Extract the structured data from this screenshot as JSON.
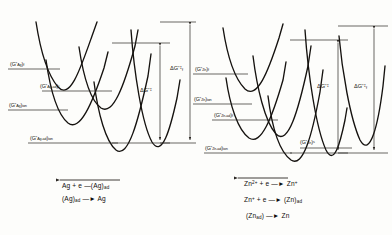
{
  "figure": {
    "panels": [
      {
        "id": "silver",
        "element": "Ag",
        "levels": [
          {
            "name": "ag-final-state",
            "text": "(G*Ag)f",
            "html": "(G<sup>*</sup><sub>Ag</sub>)<sub>f</sub>"
          },
          {
            "name": "ag-ad-final-state",
            "text": "(G*Ag-ad)f",
            "html": "(G<sup>*</sup><sub>Ag-ad</sub>)<sub>f</sub>"
          },
          {
            "name": "ag-ion-state",
            "text": "(G*Ag)ion",
            "html": "(G<sup>*</sup><sub>Ag</sub>)<sub>ion</sub>"
          },
          {
            "name": "ag-ad-ion-state",
            "text": "(G*Ag-ad)ion",
            "html": "(G<sup>*</sup><sub>Ag-ad</sub>)<sub>ion</sub>"
          }
        ],
        "deltas": [
          {
            "name": "delta-g-forward",
            "text": "ΔG*‡f",
            "html": "&Delta;G<sup>*&#8225;</sup><sub>f</sub>"
          },
          {
            "name": "delta-g",
            "text": "ΔG*‡",
            "html": "&Delta;G<sup>*&#8225;</sup>"
          }
        ],
        "reactions": [
          {
            "name": "reaction-ag-reduction",
            "html": "Ag + e &#8212;(Ag)<sub>ad</sub>",
            "reversible": true
          },
          {
            "name": "reaction-ag-incorporation",
            "html": "(Ag)<sub>ad</sub> &#8212;&#9658; Ag",
            "reversible": false
          }
        ]
      },
      {
        "id": "zinc",
        "element": "Zn",
        "levels": [
          {
            "name": "zn-final-state",
            "text": "(G*Zn)f",
            "html": "(G<sup>*</sup><sub>Zn</sub>)<sub>f</sub>"
          },
          {
            "name": "zn-ion-state",
            "text": "(G*Zn)ion",
            "html": "(G<sup>*</sup><sub>Zn</sub>)<sub>ion</sub>"
          },
          {
            "name": "zn-ad-final-state",
            "text": "(G*Zn-ad)f",
            "html": "(G<sup>*</sup><sub>Zn-ad</sub>)<sub>f</sub>"
          },
          {
            "name": "zn-ad-ion-state",
            "text": "(G*Zn-ad)ion",
            "html": "(G<sup>*</sup><sub>Zn-ad</sub>)<sub>ion</sub>"
          },
          {
            "name": "zn-solid-state",
            "text": "(G*Zn)s",
            "html": "(G<sup>*</sup><sub>Zn</sub>)<sup>s</sup>"
          }
        ],
        "deltas": [
          {
            "name": "delta-g",
            "text": "ΔG*‡",
            "html": "&Delta;G<sup>*&#8225;</sup>"
          },
          {
            "name": "delta-g-forward",
            "text": "ΔG*‡f",
            "html": "&Delta;G<sup>*&#8225;</sup><sub>f</sub>"
          }
        ],
        "reactions": [
          {
            "name": "reaction-zn-first-electron",
            "html": "Zn<sup>2+</sup> + e &#8212;&#9658; Zn<sup>+</sup>",
            "reversible": true
          },
          {
            "name": "reaction-zn-second-electron",
            "html": "Zn<sup>+</sup> + e &#8212;&#9658; (Zn)<sub>ad</sub>",
            "reversible": false
          },
          {
            "name": "reaction-zn-incorporation",
            "html": "(Zn<sub>ad</sub>) &#8212;&#9658; Zn",
            "reversible": false
          }
        ]
      }
    ],
    "colors": {
      "curve": "#15120f",
      "guide": "#2a2622",
      "background": "#fdfdfb"
    }
  }
}
